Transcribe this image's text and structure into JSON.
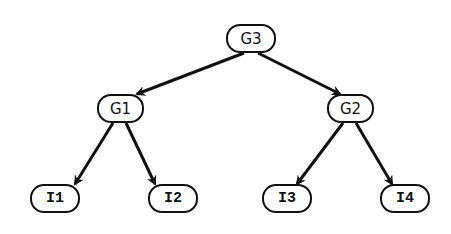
{
  "diagram": {
    "type": "tree",
    "colors": {
      "stroke": "#111111",
      "background": "#ffffff"
    },
    "nodes": [
      {
        "id": "G3",
        "label": "G3",
        "style": "sans",
        "x": 226,
        "y": 24,
        "w": 50,
        "h": 29
      },
      {
        "id": "G1",
        "label": "G1",
        "style": "sans",
        "x": 97,
        "y": 94,
        "w": 47,
        "h": 29
      },
      {
        "id": "G2",
        "label": "G2",
        "style": "sans",
        "x": 327,
        "y": 94,
        "w": 47,
        "h": 29
      },
      {
        "id": "I1",
        "label": "I1",
        "style": "mono",
        "x": 30,
        "y": 184,
        "w": 50,
        "h": 29
      },
      {
        "id": "I2",
        "label": "I2",
        "style": "mono",
        "x": 148,
        "y": 184,
        "w": 50,
        "h": 29
      },
      {
        "id": "I3",
        "label": "I3",
        "style": "mono",
        "x": 262,
        "y": 184,
        "w": 50,
        "h": 29
      },
      {
        "id": "I4",
        "label": "I4",
        "style": "mono",
        "x": 380,
        "y": 184,
        "w": 50,
        "h": 29
      }
    ],
    "edges": [
      {
        "from": "G3",
        "to": "G1",
        "x1": 244,
        "y1": 53,
        "x2": 137,
        "y2": 94
      },
      {
        "from": "G3",
        "to": "G2",
        "x1": 258,
        "y1": 53,
        "x2": 340,
        "y2": 94
      },
      {
        "from": "G1",
        "to": "I1",
        "x1": 113,
        "y1": 123,
        "x2": 75,
        "y2": 184
      },
      {
        "from": "G1",
        "to": "I2",
        "x1": 126,
        "y1": 123,
        "x2": 155,
        "y2": 184
      },
      {
        "from": "G2",
        "to": "I3",
        "x1": 343,
        "y1": 123,
        "x2": 297,
        "y2": 184
      },
      {
        "from": "G2",
        "to": "I4",
        "x1": 356,
        "y1": 123,
        "x2": 392,
        "y2": 184
      }
    ]
  }
}
